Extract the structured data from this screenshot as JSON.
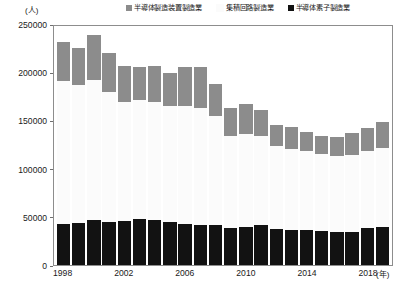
{
  "chart_data": {
    "type": "bar",
    "stacked": true,
    "title": "",
    "subtitle": "",
    "xlabel": "年",
    "ylabel": "人",
    "unit_label": "(人)",
    "x_unit_label": "(年)",
    "grid": false,
    "legend_position": "top",
    "ylim": [
      0,
      250000
    ],
    "ytick_step": 50000,
    "ytick_labels": [
      "250000",
      "200000",
      "150000",
      "100000",
      "50000",
      "0"
    ],
    "ytick_values": [
      250000,
      200000,
      150000,
      100000,
      50000,
      0
    ],
    "categories": [
      "1998",
      "1999",
      "2000",
      "2001",
      "2002",
      "2003",
      "2004",
      "2005",
      "2006",
      "2007",
      "2008",
      "2009",
      "2010",
      "2011",
      "2012",
      "2013",
      "2014",
      "2015",
      "2016",
      "2017",
      "2018",
      "2019"
    ],
    "xtick_labels": [
      "1998",
      "2002",
      "2006",
      "2010",
      "2014",
      "2018"
    ],
    "series": [
      {
        "name": "半導体素子製造業",
        "color": "#121212",
        "values": [
          43000,
          43500,
          47000,
          44500,
          46000,
          48000,
          47000,
          44500,
          43000,
          41500,
          41000,
          38000,
          39500,
          41000,
          37000,
          36500,
          36500,
          35000,
          34500,
          34000,
          38000,
          39000
        ]
      },
      {
        "name": "集積回路製造業",
        "color": "#fbfbfb",
        "values": [
          148000,
          143000,
          145000,
          135000,
          123000,
          123000,
          122000,
          120000,
          122000,
          121000,
          114000,
          96000,
          96000,
          93000,
          86000,
          84000,
          82000,
          80000,
          79000,
          80000,
          80000,
          82000
        ]
      },
      {
        "name": "半導体製造装置製造業",
        "color": "#8c8c8c",
        "values": [
          40000,
          39000,
          47000,
          40000,
          37000,
          34000,
          37000,
          35000,
          40000,
          43000,
          33000,
          29000,
          32000,
          27000,
          22000,
          23000,
          20000,
          19000,
          19000,
          23000,
          24000,
          27000
        ]
      }
    ],
    "totals": [
      231000,
      225500,
      239000,
      219500,
      206000,
      205000,
      206000,
      199500,
      205000,
      205500,
      188000,
      163000,
      167500,
      161000,
      145000,
      143500,
      138500,
      134000,
      132500,
      137000,
      142000,
      148000
    ]
  },
  "legend": {
    "items": [
      {
        "label": "半導体製造装置製造業",
        "swatch": "equip"
      },
      {
        "label": "集積回路製造業",
        "swatch": "ic"
      },
      {
        "label": "半導体素子製造業",
        "swatch": "device"
      }
    ]
  }
}
